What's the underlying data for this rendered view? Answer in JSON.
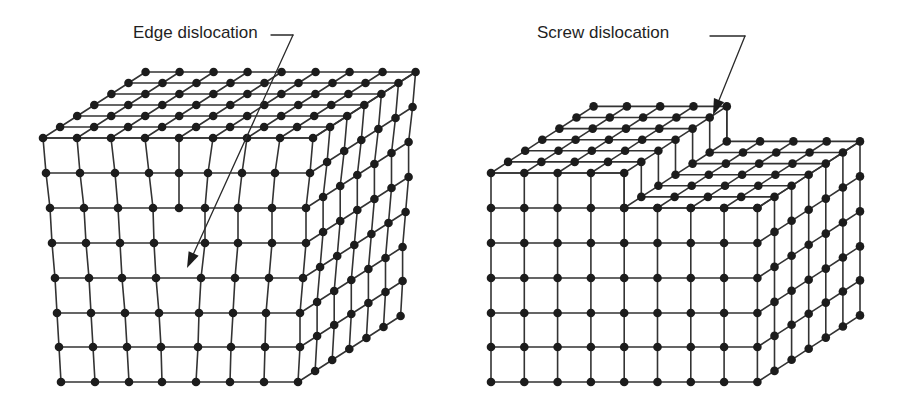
{
  "figure": {
    "panels": [
      {
        "id": "edge",
        "label": "Edge dislocation",
        "label_pos": [
          133,
          25
        ],
        "leader": {
          "points": [
            [
              271,
              35
            ],
            [
              293,
              35
            ],
            [
              212,
              208
            ]
          ],
          "arrow_tip": [
            187,
            268
          ]
        },
        "description": "Cubic crystal lattice with an extra half-plane of atoms inserted from the top, terminating inside the crystal (edge dislocation line)."
      },
      {
        "id": "screw",
        "label": "Screw dislocation",
        "label_pos": [
          537,
          25
        ],
        "leader": {
          "points": [
            [
              710,
              36
            ],
            [
              745,
              36
            ]
          ],
          "arrow_tip": [
            713,
            115
          ]
        },
        "description": "Cubic crystal lattice where part of the crystal is sheared one atomic spacing relative to the rest, creating a step on the top surface (screw dislocation line)."
      }
    ]
  },
  "colors": {
    "atom": "#1c1c1c",
    "bond": "#333333",
    "background": "#ffffff",
    "text": "#1f1f1f"
  }
}
